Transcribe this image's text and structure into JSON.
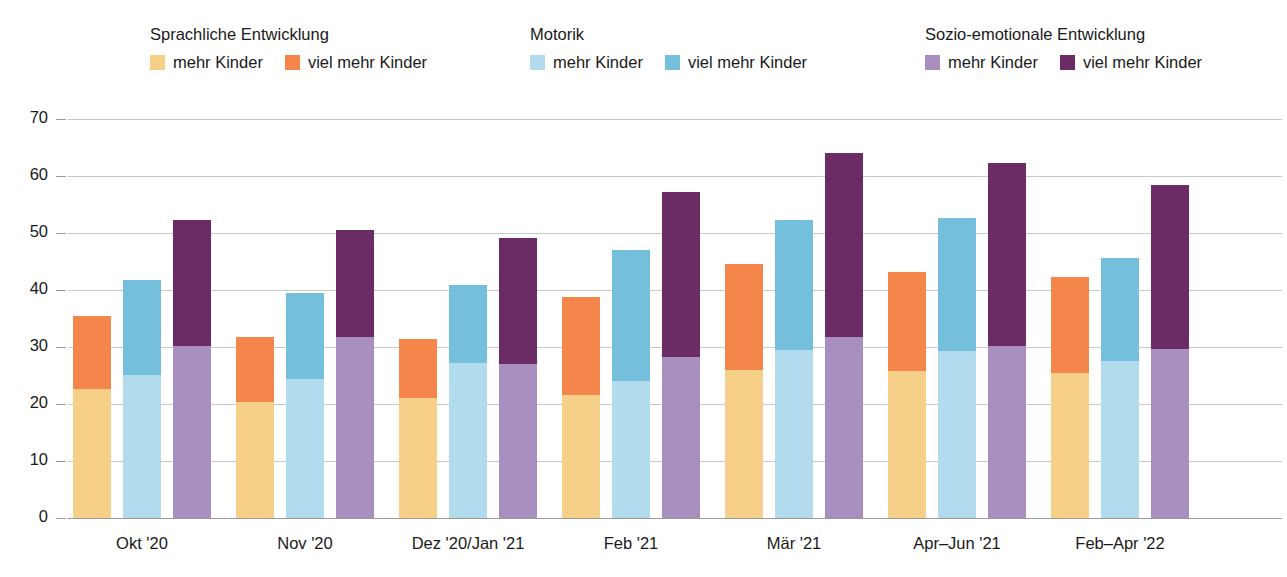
{
  "legend": {
    "groups": [
      {
        "title": "Sprachliche Entwicklung",
        "items": [
          {
            "label": "mehr Kinder",
            "color": "#f6cf89",
            "swatch_name": "legend-swatch-sprachlich-mehr"
          },
          {
            "label": "viel mehr Kinder",
            "color": "#f4854b",
            "swatch_name": "legend-swatch-sprachlich-viel-mehr"
          }
        ]
      },
      {
        "title": "Motorik",
        "items": [
          {
            "label": "mehr Kinder",
            "color": "#b2dcee",
            "swatch_name": "legend-swatch-motorik-mehr"
          },
          {
            "label": "viel mehr Kinder",
            "color": "#74bfdc",
            "swatch_name": "legend-swatch-motorik-viel-mehr"
          }
        ]
      },
      {
        "title": "Sozio-emotionale Entwicklung",
        "items": [
          {
            "label": "mehr Kinder",
            "color": "#a98fc0",
            "swatch_name": "legend-swatch-sozio-mehr"
          },
          {
            "label": "viel mehr Kinder",
            "color": "#6b2c66",
            "swatch_name": "legend-swatch-sozio-viel-mehr"
          }
        ]
      }
    ]
  },
  "chart_data": {
    "type": "bar",
    "title": "",
    "subtitle": "",
    "xlabel": "",
    "ylabel": "",
    "grid": true,
    "stacked": true,
    "grouped": true,
    "legend_position": "top",
    "ylim": [
      0,
      70
    ],
    "yticks": [
      0,
      10,
      20,
      30,
      40,
      50,
      60,
      70
    ],
    "ytick_labels": [
      "0",
      "10",
      "20",
      "30",
      "40",
      "50",
      "60",
      "70"
    ],
    "categories": [
      "Okt '20",
      "Nov '20",
      "Dez '20/Jan '21",
      "Feb '21",
      "Mär '21",
      "Apr–Jun '21",
      "Feb–Apr '22"
    ],
    "series": [
      {
        "name": "Sprachliche Entwicklung – mehr Kinder",
        "color": "#f6cf89",
        "values": [
          22.7,
          20.4,
          21.0,
          21.6,
          26.0,
          25.8,
          25.4
        ]
      },
      {
        "name": "Sprachliche Entwicklung – viel mehr Kinder",
        "color": "#f4854b",
        "values": [
          12.7,
          11.3,
          10.4,
          17.2,
          18.6,
          17.4,
          16.9
        ]
      },
      {
        "name": "Motorik – mehr Kinder",
        "color": "#b2dcee",
        "values": [
          25.1,
          24.3,
          27.2,
          24.1,
          29.5,
          29.3,
          27.6
        ]
      },
      {
        "name": "Motorik – viel mehr Kinder",
        "color": "#74bfdc",
        "values": [
          16.7,
          15.2,
          13.7,
          22.9,
          22.7,
          23.3,
          18.1
        ]
      },
      {
        "name": "Sozio-emotionale Entwicklung – mehr Kinder",
        "color": "#a98fc0",
        "values": [
          30.2,
          31.8,
          27.0,
          28.2,
          31.8,
          30.2,
          29.6
        ]
      },
      {
        "name": "Sozio-emotionale Entwicklung – viel mehr Kinder",
        "color": "#6b2c66",
        "values": [
          22.0,
          18.7,
          22.2,
          29.0,
          32.2,
          32.1,
          28.8
        ]
      }
    ],
    "totals": [
      {
        "sprachlich": 35.4,
        "motorik": 41.8,
        "sozio": 52.2
      },
      {
        "sprachlich": 31.7,
        "motorik": 39.5,
        "sozio": 50.5
      },
      {
        "sprachlich": 31.4,
        "motorik": 40.9,
        "sozio": 49.2
      },
      {
        "sprachlich": 38.8,
        "motorik": 47.0,
        "sozio": 57.2
      },
      {
        "sprachlich": 44.6,
        "motorik": 52.2,
        "sozio": 64.0
      },
      {
        "sprachlich": 43.2,
        "motorik": 52.6,
        "sozio": 62.3
      },
      {
        "sprachlich": 42.3,
        "motorik": 45.7,
        "sozio": 58.4
      }
    ]
  }
}
